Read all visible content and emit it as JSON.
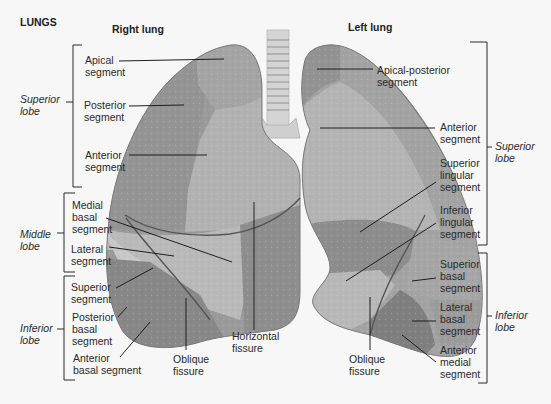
{
  "title": "LUNGS",
  "right_lung": {
    "heading": "Right lung",
    "lobes": {
      "superior": {
        "label_line1": "Superior",
        "label_line2": "lobe"
      },
      "middle": {
        "label_line1": "Middle",
        "label_line2": "lobe"
      },
      "inferior": {
        "label_line1": "Inferior",
        "label_line2": "lobe"
      }
    },
    "segments": {
      "apical": [
        "Apical",
        "segment"
      ],
      "posterior": [
        "Posterior",
        "segment"
      ],
      "anterior": [
        "Anterior",
        "segment"
      ],
      "medial_basal": [
        "Medial",
        "basal",
        "segment"
      ],
      "lateral": [
        "Lateral",
        "segment"
      ],
      "superior": [
        "Superior",
        "segment"
      ],
      "posterior_basal": [
        "Posterior",
        "basal",
        "segment"
      ],
      "anterior_basal": [
        "Anterior",
        "basal segment"
      ]
    },
    "fissures": {
      "oblique": [
        "Oblique",
        "fissure"
      ],
      "horizontal": [
        "Horizontal",
        "fissure"
      ]
    }
  },
  "left_lung": {
    "heading": "Left lung",
    "lobes": {
      "superior": {
        "label_line1": "Superior",
        "label_line2": "lobe"
      },
      "inferior": {
        "label_line1": "Inferior",
        "label_line2": "lobe"
      }
    },
    "segments": {
      "apical_posterior": [
        "Apical-posterior",
        "segment"
      ],
      "anterior": [
        "Anterior",
        "segment"
      ],
      "superior_lingular": [
        "Superior",
        "lingular",
        "segment"
      ],
      "inferior_lingular": [
        "Inferior",
        "lingular",
        "segment"
      ],
      "superior_basal": [
        "Superior",
        "basal",
        "segment"
      ],
      "lateral_basal": [
        "Lateral",
        "basal",
        "segment"
      ],
      "anterior_medial": [
        "Anterior",
        "medial",
        "segment"
      ]
    },
    "fissures": {
      "oblique": [
        "Oblique",
        "fissure"
      ]
    }
  },
  "colors": {
    "background": "#f7f7f7",
    "lung_dark": "#8e8e8e",
    "lung_mid": "#a8a8a8",
    "lung_light": "#c2c2c2",
    "lung_lighter": "#cfcfcf",
    "trachea": "#d6d6d6",
    "leader": "#1e1e1e"
  }
}
